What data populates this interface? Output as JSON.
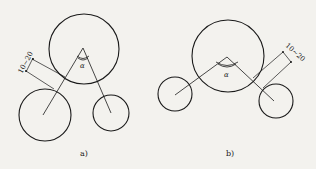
{
  "figure": {
    "colors": {
      "background": "#f3f2ee",
      "stroke": "#1a1a1a"
    },
    "panels": [
      {
        "id": "a",
        "caption": "a)",
        "angle_label": "α",
        "dimension_label": "10~20",
        "large_circle": {
          "cx": 84,
          "cy": 49,
          "r": 35
        },
        "small_circles": [
          {
            "cx": 45,
            "cy": 115,
            "r": 26
          },
          {
            "cx": 111,
            "cy": 113,
            "r": 18
          }
        ],
        "apex": {
          "x": 83,
          "y": 48
        }
      },
      {
        "id": "b",
        "caption": "b)",
        "angle_label": "α",
        "dimension_label": "10~20",
        "large_circle": {
          "cx": 228,
          "cy": 56,
          "r": 36
        },
        "small_circles": [
          {
            "cx": 175,
            "cy": 94,
            "r": 17
          },
          {
            "cx": 276,
            "cy": 101,
            "r": 17
          }
        ],
        "apex": {
          "x": 227,
          "y": 57
        }
      }
    ]
  }
}
